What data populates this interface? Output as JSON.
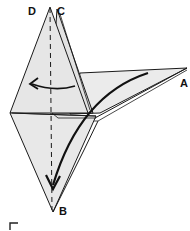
{
  "figure": {
    "type": "origami-fold-diagram",
    "step_number": "5",
    "labels": {
      "D": "D",
      "C": "C",
      "A": "A",
      "B": "B"
    },
    "colors": {
      "paper": "#e6e6e6",
      "paper_light": "#efefef",
      "line": "#1a1a1a",
      "background": "#ffffff"
    },
    "arrows": [
      {
        "name": "fold-left-arrow",
        "direction": "left",
        "description": "Flap folds to the left"
      },
      {
        "name": "fold-down-arrow",
        "direction": "down",
        "description": "Point A swings down toward B"
      }
    ],
    "fold_lines": [
      {
        "name": "center-valley-fold-line",
        "style": "dashed",
        "orientation": "vertical"
      }
    ]
  }
}
